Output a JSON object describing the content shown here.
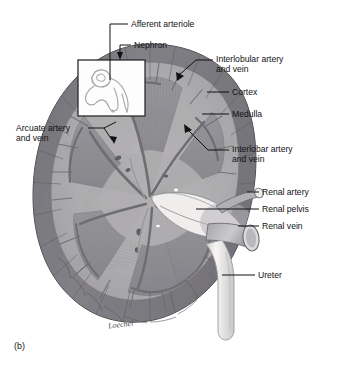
{
  "figure": {
    "caption": "(b)",
    "signature": "Loechel",
    "style": "grayscale-medical-illustration"
  },
  "labels": [
    {
      "id": "afferent-arteriole",
      "text": "Afferent arteriole",
      "lines": [
        "Afferent arteriole"
      ],
      "x": 131,
      "y": 27,
      "align": "left"
    },
    {
      "id": "nephron",
      "text": "Nephron",
      "lines": [
        "Nephron"
      ],
      "x": 134,
      "y": 48,
      "align": "left"
    },
    {
      "id": "interlobular-artery-and-vein",
      "text": "Interlobular artery and vein",
      "lines": [
        "Interlobular artery",
        "and vein"
      ],
      "x": 216,
      "y": 58,
      "align": "left"
    },
    {
      "id": "cortex",
      "text": "Cortex",
      "lines": [
        "Cortex"
      ],
      "x": 232,
      "y": 95,
      "align": "left"
    },
    {
      "id": "medulla",
      "text": "Medulla",
      "lines": [
        "Medulla"
      ],
      "x": 232,
      "y": 117,
      "align": "left"
    },
    {
      "id": "interlobar-artery-and-vein",
      "text": "Interlobar artery and vein",
      "lines": [
        "Interlobar artery",
        "and vein"
      ],
      "x": 232,
      "y": 147,
      "align": "left"
    },
    {
      "id": "arcuate-artery-and-vein",
      "text": "Arcuate artery and vein",
      "lines": [
        "Arcuate artery",
        "and vein"
      ],
      "x": 16,
      "y": 126,
      "align": "left"
    },
    {
      "id": "renal-artery",
      "text": "Renal artery",
      "lines": [
        "Renal artery"
      ],
      "x": 262,
      "y": 194,
      "align": "left"
    },
    {
      "id": "renal-pelvis",
      "text": "Renal pelvis",
      "lines": [
        "Renal pelvis"
      ],
      "x": 262,
      "y": 211,
      "align": "left"
    },
    {
      "id": "renal-vein",
      "text": "Renal vein",
      "lines": [
        "Renal vein"
      ],
      "x": 262,
      "y": 228,
      "align": "left"
    },
    {
      "id": "ureter",
      "text": "Ureter",
      "lines": [
        "Ureter"
      ],
      "x": 258,
      "y": 277,
      "align": "left"
    }
  ],
  "inset": {
    "id": "nephron-inset-box",
    "x": 78,
    "y": 60,
    "width": 67,
    "height": 56
  },
  "colors": {
    "cortex_dark": "#77767a",
    "cortex_mid": "#8e8d91",
    "medulla": "#a9a8ac",
    "medulla_light": "#c4c3c7",
    "sinus_pale": "#efeeec",
    "vessel": "#828186",
    "outline": "#4a4a4e",
    "leader": "#1a1a1a",
    "text": "#111111",
    "background": "#ffffff"
  }
}
